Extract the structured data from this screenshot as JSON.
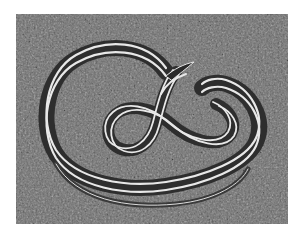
{
  "image": {
    "subject": "striped snake coiled on grass",
    "alt": "Black-and-white photograph of a striped garter snake coiled on grass",
    "colors": {
      "background_page": "#ffffff",
      "grass": "#6e6e6e",
      "snake_body": "#3a3a3a",
      "snake_stripe": "#e8e8e8"
    }
  }
}
